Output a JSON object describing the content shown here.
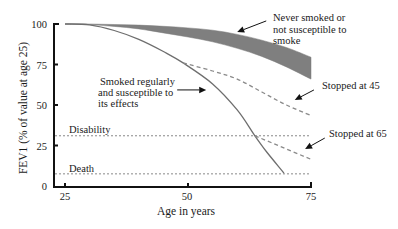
{
  "chart_data": {
    "type": "line",
    "title": "",
    "xlabel": "Age in years",
    "ylabel": "FEV1 (% of value at age 25)",
    "xlim": [
      25,
      75
    ],
    "ylim": [
      0,
      100
    ],
    "xticks": [
      25,
      50,
      75
    ],
    "yticks": [
      0,
      25,
      50,
      75,
      100
    ],
    "grid": false,
    "legend": null,
    "series": [
      {
        "name": "Never smoked or not susceptible to smoke",
        "type": "band",
        "x": [
          25,
          30,
          35,
          40,
          45,
          50,
          55,
          60,
          65,
          70,
          75
        ],
        "upper": [
          100,
          100,
          99.7,
          99.3,
          98.6,
          97.6,
          96.2,
          93.6,
          90,
          85.5,
          79.5
        ],
        "lower": [
          100,
          99.6,
          98.5,
          97,
          94.5,
          92,
          89,
          85,
          80,
          73.5,
          66
        ]
      },
      {
        "name": "Smoked regularly and susceptible to its effects",
        "type": "line",
        "style": "solid",
        "x": [
          25,
          30,
          35,
          40,
          45,
          49,
          55,
          60,
          63.6,
          66,
          69.5
        ],
        "y": [
          100,
          99.5,
          96,
          90.5,
          83,
          76,
          63,
          47,
          31,
          21,
          8
        ]
      },
      {
        "name": "Stopped at 45",
        "type": "line",
        "style": "dashed",
        "x": [
          49,
          55,
          60,
          65,
          70,
          75
        ],
        "y": [
          76,
          71,
          66,
          58,
          50,
          43.5
        ]
      },
      {
        "name": "Stopped at 65",
        "type": "line",
        "style": "dashed",
        "x": [
          63.6,
          75
        ],
        "y": [
          31,
          16.5
        ]
      }
    ],
    "reference_lines": [
      {
        "label": "Disability",
        "y": 31
      },
      {
        "label": "Death",
        "y": 7.5
      }
    ],
    "annotations": {
      "never": {
        "lines": [
          "Never smoked or",
          "not susceptible to",
          "smoke"
        ],
        "arrow_from": [
          65.9,
          101.9
        ],
        "arrow_to": [
          60,
          95
        ]
      },
      "smoked": {
        "lines": [
          "Smoked regularly",
          "and susceptible to",
          "its effects"
        ],
        "arrow_from": [
          47.8,
          59.3
        ],
        "arrow_to": [
          53.7,
          59.3
        ]
      },
      "stop45": {
        "lines": [
          "Stopped at 45"
        ],
        "arrow_from": [
          75.6,
          59.3
        ],
        "arrow_to": [
          71.7,
          53.1
        ]
      },
      "stop65": {
        "lines": [
          "Stopped at 65"
        ],
        "arrow_from": [
          77.8,
          29.6
        ],
        "arrow_to": [
          73.8,
          22.8
        ]
      }
    }
  }
}
